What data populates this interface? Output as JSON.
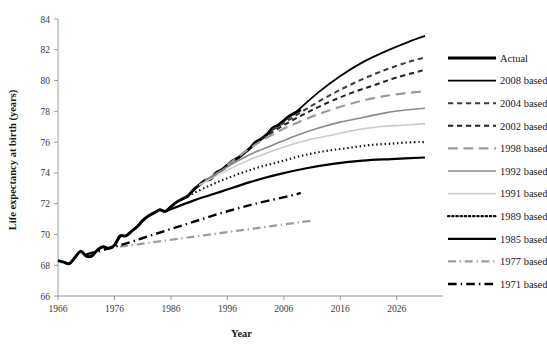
{
  "chart_data": {
    "type": "line",
    "title": "",
    "xlabel": "Year",
    "ylabel": "Life expectancy at birth (years)",
    "xlim": [
      1966,
      2031
    ],
    "ylim": [
      66,
      84
    ],
    "xticks": [
      1966,
      1976,
      1986,
      1996,
      2006,
      2016,
      2026
    ],
    "yticks": [
      66,
      68,
      70,
      72,
      74,
      76,
      78,
      80,
      82,
      84
    ],
    "grid": false,
    "legend_position": "right",
    "series": [
      {
        "name": "Actual",
        "style": "solid",
        "color": "#000000",
        "width": 3.0,
        "x": [
          1966,
          1967,
          1968,
          1969,
          1970,
          1971,
          1972,
          1973,
          1974,
          1975,
          1976,
          1977,
          1978,
          1979,
          1980,
          1981,
          1982,
          1983,
          1984,
          1985,
          1986,
          1987,
          1988,
          1989,
          1990,
          1991,
          1992,
          1993,
          1994,
          1995,
          1996,
          1997,
          1998,
          1999,
          2000,
          2001,
          2002,
          2003,
          2004,
          2005,
          2006,
          2007,
          2008,
          2009
        ],
        "y": [
          68.3,
          68.2,
          68.1,
          68.5,
          68.9,
          68.6,
          68.6,
          69.0,
          69.2,
          69.1,
          69.3,
          69.9,
          69.9,
          70.2,
          70.5,
          70.9,
          71.2,
          71.4,
          71.6,
          71.5,
          71.8,
          72.1,
          72.3,
          72.5,
          72.9,
          73.2,
          73.5,
          73.6,
          74.0,
          74.2,
          74.5,
          74.8,
          75.0,
          75.3,
          75.6,
          76.0,
          76.2,
          76.5,
          76.9,
          77.1,
          77.4,
          77.7,
          77.9,
          78.1
        ]
      },
      {
        "name": "2008 based",
        "style": "solid",
        "color": "#000000",
        "width": 1.8,
        "x": [
          2008,
          2012,
          2016,
          2020,
          2024,
          2028,
          2031
        ],
        "y": [
          77.9,
          79.2,
          80.3,
          81.2,
          81.9,
          82.5,
          82.9
        ]
      },
      {
        "name": "2004 based",
        "style": "dashed",
        "color": "#3c3c3c",
        "width": 2.0,
        "x": [
          2004,
          2008,
          2012,
          2016,
          2020,
          2024,
          2028,
          2031
        ],
        "y": [
          76.8,
          77.7,
          78.6,
          79.4,
          80.1,
          80.7,
          81.2,
          81.5
        ]
      },
      {
        "name": "2002 based",
        "style": "dashed",
        "color": "#222222",
        "width": 2.0,
        "x": [
          2002,
          2006,
          2010,
          2014,
          2018,
          2022,
          2026,
          2031
        ],
        "y": [
          76.2,
          77.1,
          77.9,
          78.6,
          79.2,
          79.7,
          80.2,
          80.7
        ]
      },
      {
        "name": "1998 based",
        "style": "long-dash",
        "color": "#9b9b9b",
        "width": 2.2,
        "x": [
          1996,
          2000,
          2004,
          2008,
          2012,
          2016,
          2020,
          2024,
          2028,
          2031
        ],
        "y": [
          74.5,
          75.6,
          76.5,
          77.2,
          77.8,
          78.3,
          78.7,
          79.0,
          79.2,
          79.3
        ]
      },
      {
        "name": "1992 based",
        "style": "solid",
        "color": "#8a8a8a",
        "width": 1.6,
        "x": [
          1992,
          1996,
          2000,
          2004,
          2008,
          2012,
          2016,
          2020,
          2024,
          2028,
          2031
        ],
        "y": [
          73.5,
          74.4,
          75.2,
          75.8,
          76.4,
          76.9,
          77.3,
          77.6,
          77.9,
          78.1,
          78.2
        ]
      },
      {
        "name": "1991 based",
        "style": "solid",
        "color": "#cacaca",
        "width": 1.6,
        "x": [
          1991,
          1995,
          1999,
          2003,
          2007,
          2011,
          2015,
          2019,
          2023,
          2027,
          2031
        ],
        "y": [
          73.2,
          74.0,
          74.7,
          75.3,
          75.8,
          76.2,
          76.5,
          76.8,
          77.0,
          77.1,
          77.2
        ]
      },
      {
        "name": "1989 based",
        "style": "dotted",
        "color": "#111111",
        "width": 2.2,
        "x": [
          1989,
          1993,
          1997,
          2001,
          2005,
          2009,
          2013,
          2017,
          2021,
          2025,
          2029,
          2031
        ],
        "y": [
          72.5,
          73.2,
          73.8,
          74.3,
          74.7,
          75.1,
          75.4,
          75.6,
          75.8,
          75.9,
          76.0,
          76.0
        ]
      },
      {
        "name": "1985 based",
        "style": "solid",
        "color": "#000000",
        "width": 2.2,
        "x": [
          1985,
          1990,
          1995,
          2000,
          2005,
          2010,
          2015,
          2020,
          2025,
          2031
        ],
        "y": [
          71.5,
          72.2,
          72.8,
          73.4,
          73.9,
          74.3,
          74.6,
          74.8,
          74.9,
          75.0
        ]
      },
      {
        "name": "1977 based",
        "style": "dash-dot",
        "color": "#9b9b9b",
        "width": 2.2,
        "x": [
          1977,
          1983,
          1989,
          1995,
          2001,
          2007,
          2011
        ],
        "y": [
          69.2,
          69.5,
          69.8,
          70.1,
          70.4,
          70.7,
          70.9
        ]
      },
      {
        "name": "1971 based",
        "style": "dash-dot",
        "color": "#000000",
        "width": 2.4,
        "x": [
          1971,
          1977,
          1983,
          1989,
          1995,
          2001,
          2007,
          2009
        ],
        "y": [
          68.7,
          69.3,
          70.0,
          70.7,
          71.4,
          72.0,
          72.5,
          72.7
        ]
      }
    ]
  },
  "legend": {
    "items": [
      {
        "label": "Actual"
      },
      {
        "label": "2008 based"
      },
      {
        "label": "2004 based"
      },
      {
        "label": "2002 based"
      },
      {
        "label": "1998 based"
      },
      {
        "label": "1992 based"
      },
      {
        "label": "1991 based"
      },
      {
        "label": "1989 based"
      },
      {
        "label": "1985 based"
      },
      {
        "label": "1977 based"
      },
      {
        "label": "1971 based"
      }
    ]
  }
}
